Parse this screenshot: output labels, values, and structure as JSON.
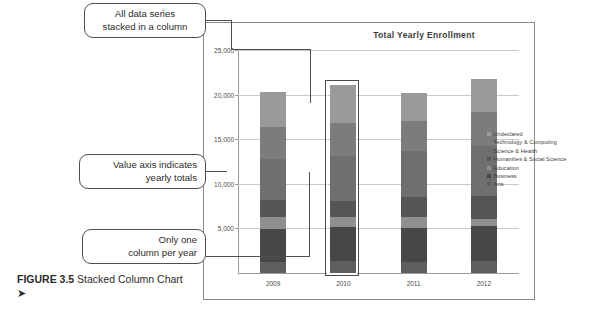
{
  "figure": {
    "label": "FIGURE 3.5",
    "caption": "Stacked Column Chart",
    "arrow": "➤"
  },
  "callouts": [
    {
      "name": "all-data-series",
      "line1": "All data series",
      "line2": "stacked in a column"
    },
    {
      "name": "value-axis",
      "line1": "Value axis indicates",
      "line2": "yearly totals"
    },
    {
      "name": "one-column-per-year",
      "line1": "Only one",
      "line2": "column per year"
    }
  ],
  "chart_data": {
    "type": "bar",
    "title": "Total Yearly Enrollment",
    "xlabel": "",
    "ylabel": "",
    "stacked": true,
    "grid": true,
    "legend_position": "right",
    "ylim": [
      0,
      25000
    ],
    "yticks": [
      0,
      5000,
      10000,
      15000,
      20000,
      25000
    ],
    "ytick_labels": [
      "",
      "5,000",
      "10,000",
      "15,000",
      "20,000",
      "25,000"
    ],
    "categories": [
      "2009",
      "2010",
      "2011",
      "2012"
    ],
    "selected_category": "2010",
    "series": [
      {
        "name": "Arts",
        "color": "#5e5e5e",
        "values": [
          1200,
          1300,
          1250,
          1300
        ]
      },
      {
        "name": "Business",
        "color": "#474747",
        "values": [
          3700,
          3900,
          3800,
          4000
        ]
      },
      {
        "name": "Education",
        "color": "#8f8f8f",
        "values": [
          1400,
          1100,
          1200,
          800
        ]
      },
      {
        "name": "Humanities & Social Science",
        "color": "#555555",
        "values": [
          1900,
          1800,
          2300,
          2500
        ]
      },
      {
        "name": "Science & Health",
        "color": "#6f6f6f",
        "values": [
          4600,
          5000,
          5150,
          5600
        ]
      },
      {
        "name": "Technology & Computing",
        "color": "#7c7c7c",
        "values": [
          3600,
          3700,
          3400,
          3900
        ]
      },
      {
        "name": "Undeclared",
        "color": "#9a9a9a",
        "values": [
          3900,
          4300,
          3100,
          3600
        ]
      }
    ],
    "totals": [
      20300,
      21100,
      20200,
      21700
    ]
  }
}
